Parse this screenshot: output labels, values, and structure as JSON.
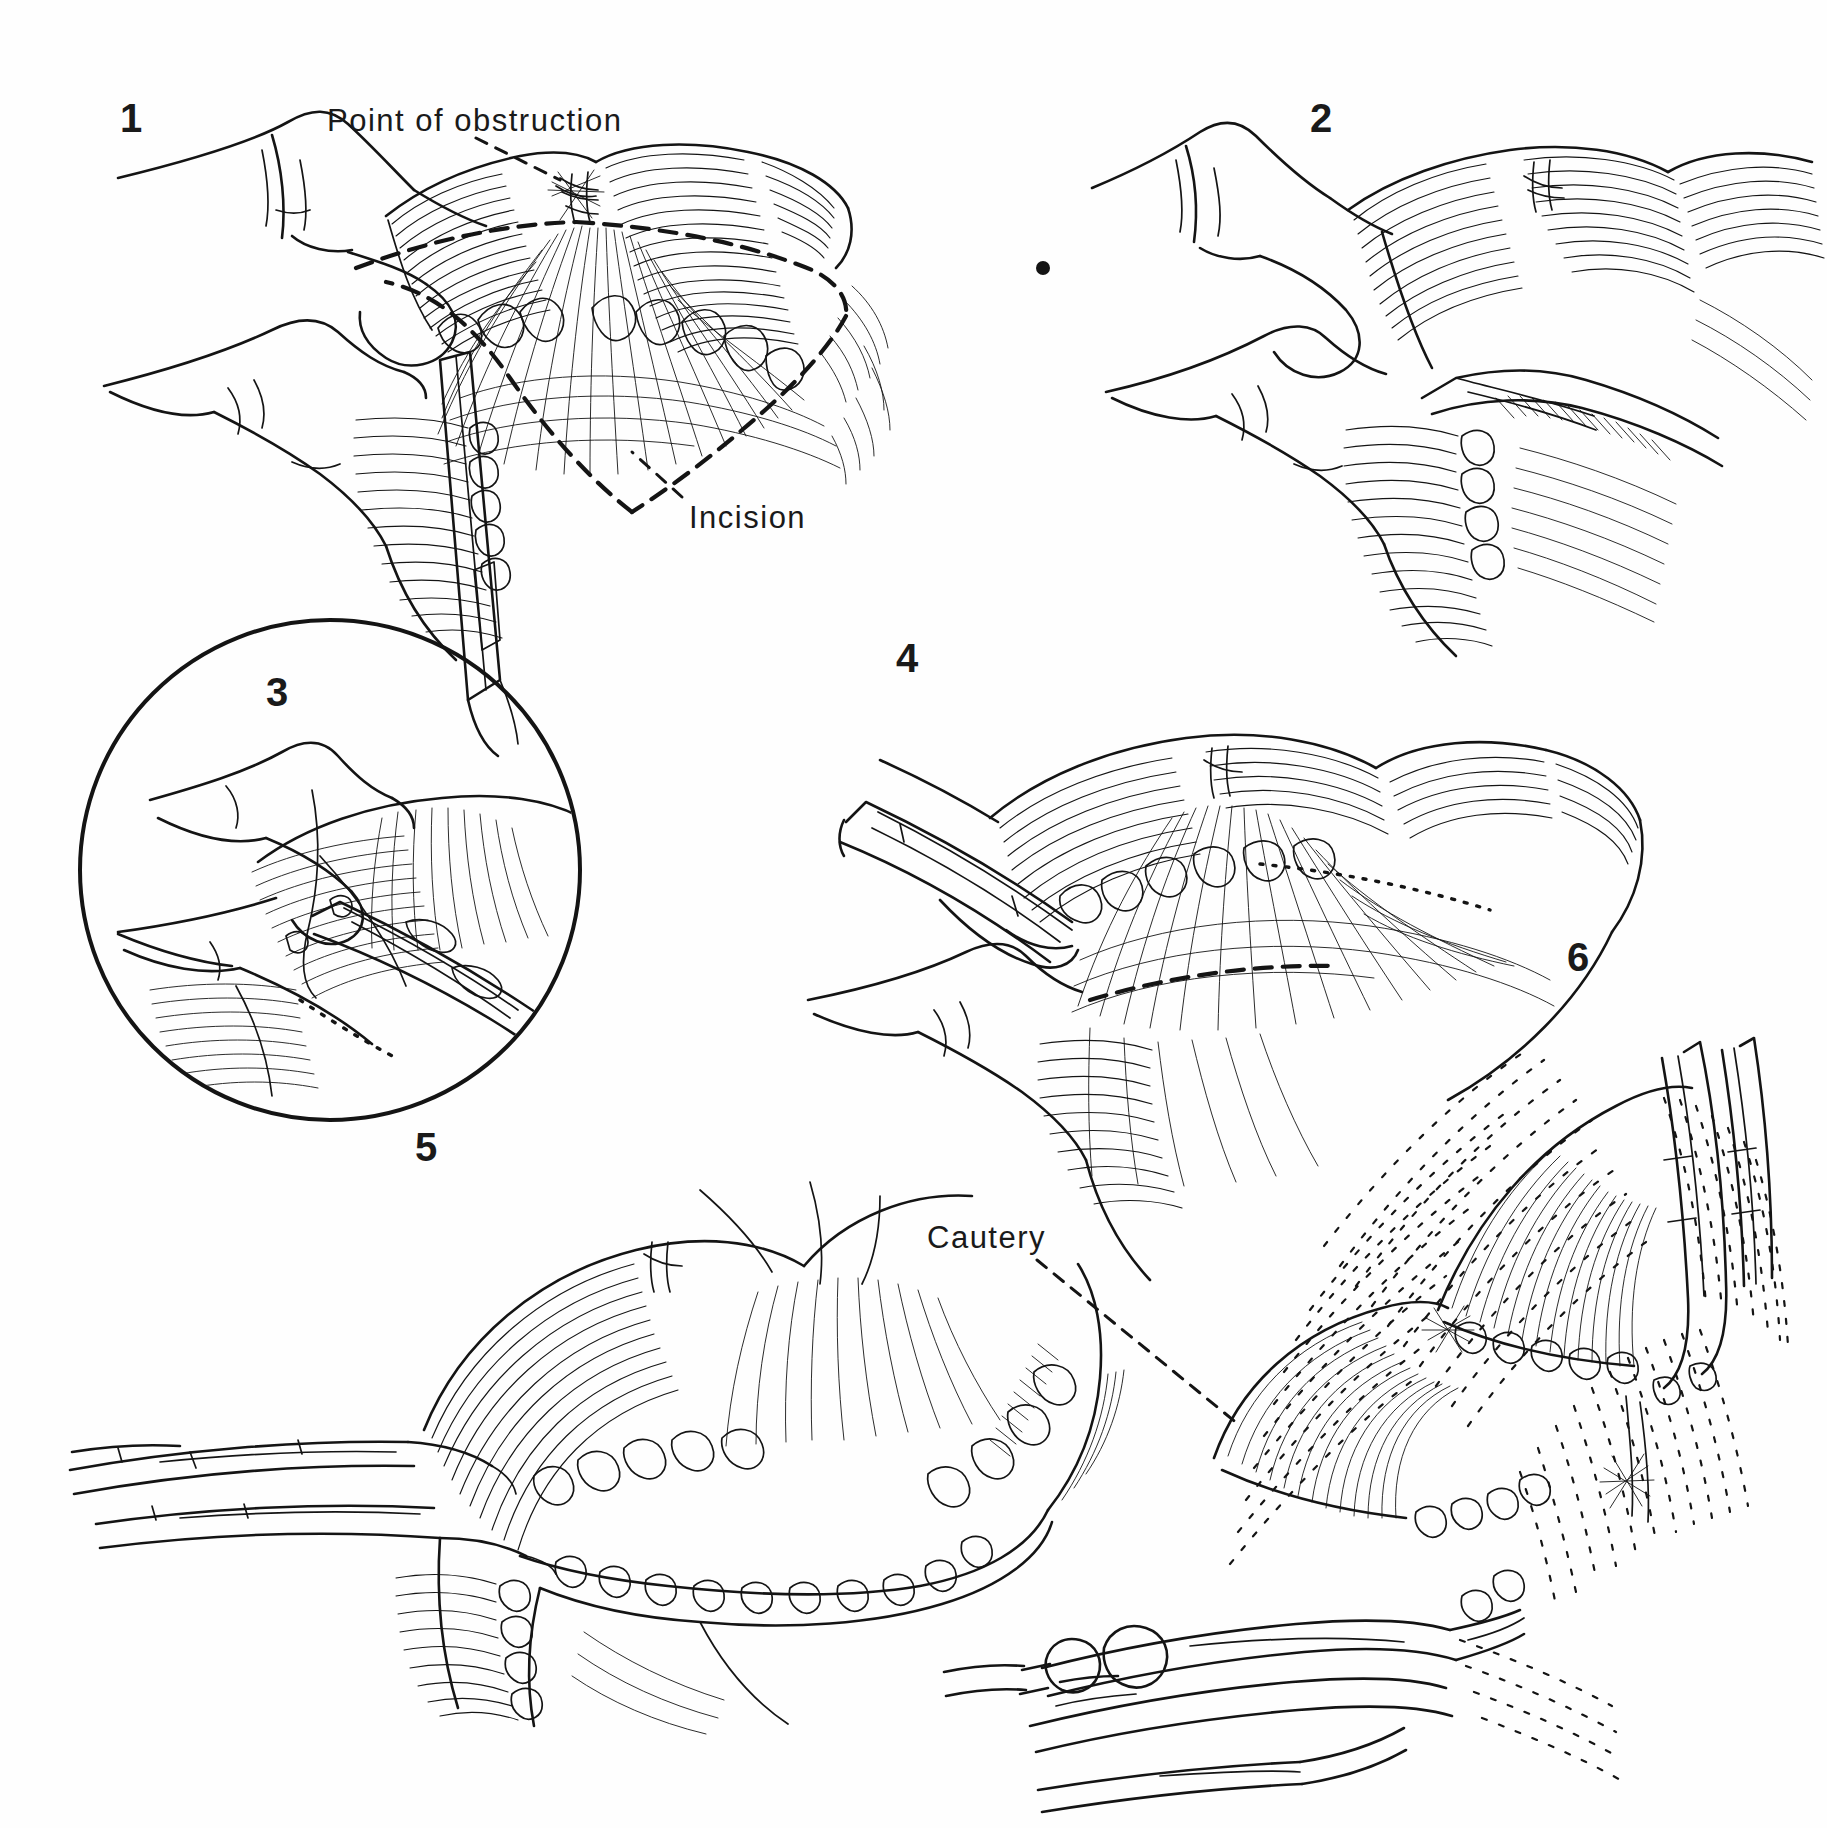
{
  "plate": {
    "type": "surgical-technique-illustration",
    "medium": "pen-and-ink line drawing",
    "background_color": "#fefefe",
    "ink_color": "#141414",
    "panel_count": 6
  },
  "panels": [
    {
      "number": "1",
      "num_x": 120,
      "num_y": 96,
      "description": "Surgeon's two fingers pinch the bowel on either side of the strictured segment; a dashed diamond marks the planned longitudinal incision across the antimesenteric border. A scalpel enters from below.",
      "labels": [
        "Point of obstruction",
        "Incision"
      ]
    },
    {
      "number": "2",
      "num_x": 1310,
      "num_y": 96,
      "description": "Fingers steady the bowel while a fine clamp/scissor is introduced through the opened enterotomy at the point of obstruction."
    },
    {
      "number": "3",
      "num_x": 266,
      "num_y": 670,
      "description": "Circular magnified inset of the enterotomy: the instrument tip is advanced through the narrowed lumen under the fingertip."
    },
    {
      "number": "4",
      "num_x": 896,
      "num_y": 636,
      "description": "Long clamp passed obliquely through the bowel wall opening; the mesenteric fan is displayed with the dashed incision line at right."
    },
    {
      "number": "5",
      "num_x": 415,
      "num_y": 1125,
      "description": "Two long forceps from the left hold the open bowel loop wide apart, exposing the full length of the incised segment."
    },
    {
      "number": "6",
      "num_x": 1567,
      "num_y": 935,
      "description": "Stippled field view: cautery applied at the base of the opened segment while a retractor holds the wall; surrounding tissue rendered in broken stipple hatching.",
      "labels": [
        "Cautery"
      ]
    }
  ],
  "callouts": [
    {
      "id": "point-of-obstruction",
      "text": "Point of obstruction",
      "text_x": 327,
      "text_y": 103,
      "leader": {
        "x1": 476,
        "y1": 138,
        "x2": 560,
        "y2": 180
      },
      "panel": "1"
    },
    {
      "id": "incision",
      "text": "Incision",
      "text_x": 689,
      "text_y": 500,
      "leader": {
        "x1": 682,
        "y1": 497,
        "x2": 632,
        "y2": 452
      },
      "panel": "1"
    },
    {
      "id": "cautery",
      "text": "Cautery",
      "text_x": 927,
      "text_y": 1220,
      "leader": {
        "x1": 1037,
        "y1": 1260,
        "x2": 1238,
        "y2": 1424
      },
      "panel": "6"
    }
  ],
  "artifacts": [
    {
      "id": "ink-dot",
      "x": 1043,
      "y": 268,
      "r": 7
    }
  ]
}
